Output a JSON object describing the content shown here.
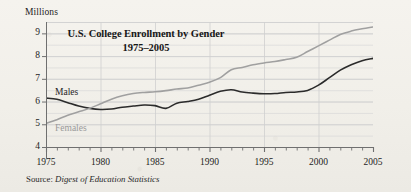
{
  "axis_label": "Millions",
  "title_line1": "U.S. College Enrollment by Gender",
  "title_line2": "1975–2005",
  "source": {
    "label": "Source:",
    "body": "Digest of Education Statistics"
  },
  "series_labels": {
    "males": "Males",
    "females": "Females"
  },
  "colors": {
    "males_line": "#2b2b2b",
    "females_line": "#a0a0a0",
    "axis": "#6f6f6f",
    "grid": "#d8d8d8",
    "grid_major": "#cfcfcf",
    "text": "#1c1c1c",
    "background": "#f3f1ec"
  },
  "chart_data": {
    "type": "line",
    "title": "U.S. College Enrollment by Gender 1975–2005",
    "subtitle": "1975–2005",
    "xlabel": "",
    "ylabel": "Millions",
    "xlim": [
      1975,
      2005
    ],
    "ylim": [
      4,
      9.5
    ],
    "yticks": [
      4,
      5,
      6,
      7,
      8,
      9
    ],
    "ytick_labels": [
      "4",
      "5",
      "6",
      "7",
      "8",
      "9"
    ],
    "xticks": [
      1975,
      1980,
      1985,
      1990,
      1995,
      2000,
      2005
    ],
    "xtick_labels": [
      "1975",
      "1980",
      "1985",
      "1990",
      "1995",
      "2000",
      "2005"
    ],
    "minor_xticks_every": 1,
    "minor_ygrid_every": 0.5,
    "grid": true,
    "legend": "inline-labels",
    "annotations": [
      "Males",
      "Females"
    ],
    "x": [
      1975,
      1976,
      1977,
      1978,
      1979,
      1980,
      1981,
      1982,
      1983,
      1984,
      1985,
      1986,
      1987,
      1988,
      1989,
      1990,
      1991,
      1992,
      1993,
      1994,
      1995,
      1996,
      1997,
      1998,
      1999,
      2000,
      2001,
      2002,
      2003,
      2004,
      2005
    ],
    "series": [
      {
        "name": "Males",
        "color": "#2b2b2b",
        "values": [
          6.15,
          6.1,
          5.95,
          5.8,
          5.7,
          5.65,
          5.67,
          5.75,
          5.8,
          5.85,
          5.82,
          5.7,
          5.93,
          6.0,
          6.1,
          6.28,
          6.45,
          6.52,
          6.42,
          6.37,
          6.34,
          6.35,
          6.4,
          6.42,
          6.49,
          6.72,
          7.05,
          7.38,
          7.62,
          7.8,
          7.9
        ]
      },
      {
        "name": "Females",
        "color": "#a0a0a0",
        "values": [
          5.04,
          5.2,
          5.4,
          5.55,
          5.7,
          5.9,
          6.1,
          6.25,
          6.35,
          6.4,
          6.43,
          6.48,
          6.55,
          6.6,
          6.72,
          6.85,
          7.05,
          7.4,
          7.5,
          7.62,
          7.7,
          7.76,
          7.85,
          7.95,
          8.2,
          8.45,
          8.7,
          8.95,
          9.1,
          9.2,
          9.28
        ]
      }
    ]
  }
}
